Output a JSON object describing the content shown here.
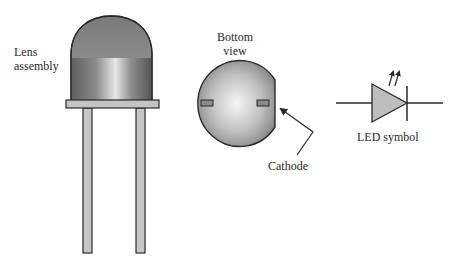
{
  "diagram": {
    "labels": {
      "lens_line1": "Lens",
      "lens_line2": "assembly",
      "bottom_line1": "Bottom",
      "bottom_line2": "view",
      "cathode": "Cathode",
      "led_symbol": "LED symbol"
    },
    "parts": {
      "lens": "lens-assembly",
      "flange": "base-flange",
      "leads": [
        "anode-lead",
        "cathode-lead"
      ],
      "bottom_view": "bottom-view-disc",
      "symbol": "led-schematic-symbol"
    },
    "colors": {
      "outline": "#2a2a2a",
      "lens_dark": "#6e6e6e",
      "lens_light": "#d8d8d8",
      "lead_fill": "#c6c6c6",
      "flange_fill": "#c4c4c4",
      "disc_light": "#f2f2f2",
      "disc_dark": "#8c8c8c",
      "triangle_fill": "#bdbdbd"
    }
  }
}
